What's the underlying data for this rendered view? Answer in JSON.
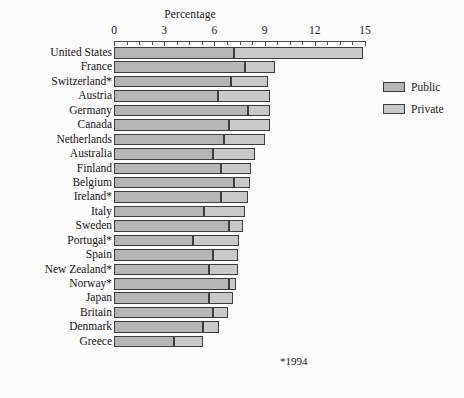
{
  "chart_data": {
    "type": "bar",
    "orientation": "horizontal",
    "stacked": true,
    "title": "Percentage",
    "xlabel": "Percentage",
    "ylabel": "",
    "xlim": [
      0,
      15
    ],
    "xticks": [
      0,
      3,
      6,
      9,
      12,
      15
    ],
    "xtick_labels": [
      "0",
      "3",
      "6",
      "9",
      "12",
      "15"
    ],
    "minor_tick_step": 0.75,
    "grid": false,
    "legend_position": "right",
    "footnote": "*1994",
    "categories": [
      "United States",
      "France",
      "Switzerland*",
      "Austria",
      "Germany",
      "Canada",
      "Netherlands",
      "Australia",
      "Finland",
      "Belgium",
      "Ireland*",
      "Italy",
      "Sweden",
      "Portugal*",
      "Spain",
      "New Zealand*",
      "Norway*",
      "Japan",
      "Britain",
      "Denmark",
      "Greece"
    ],
    "series": [
      {
        "name": "Public",
        "color": "#b5b5b5",
        "values": [
          7.2,
          7.8,
          7.0,
          6.2,
          8.0,
          6.9,
          6.6,
          5.9,
          6.4,
          7.2,
          6.4,
          5.4,
          6.9,
          4.7,
          5.9,
          5.7,
          6.9,
          5.7,
          5.9,
          5.3,
          3.6
        ]
      },
      {
        "name": "Private",
        "color": "#c9c9c9",
        "values": [
          7.7,
          1.8,
          2.2,
          3.1,
          1.3,
          2.4,
          2.4,
          2.5,
          1.8,
          0.9,
          1.6,
          2.4,
          0.8,
          2.8,
          1.5,
          1.7,
          0.4,
          1.4,
          0.9,
          1.0,
          1.7
        ]
      }
    ],
    "totals": [
      14.9,
      9.6,
      9.2,
      9.3,
      9.3,
      9.3,
      9.0,
      8.4,
      8.2,
      8.1,
      8.0,
      7.8,
      7.7,
      7.5,
      7.4,
      7.4,
      7.3,
      7.1,
      6.8,
      6.3,
      5.3
    ]
  },
  "legend": {
    "items": [
      {
        "label": "Public"
      },
      {
        "label": "Private"
      }
    ]
  }
}
